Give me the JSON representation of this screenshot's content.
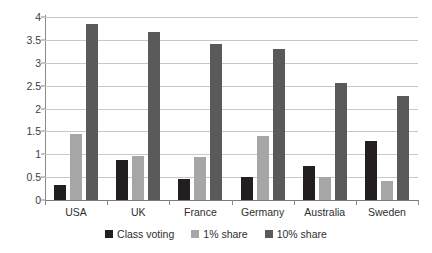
{
  "chart_data": {
    "type": "bar",
    "title": "",
    "subtitle": "",
    "xlabel": "",
    "ylabel": "",
    "categories": [
      "USA",
      "UK",
      "France",
      "Germany",
      "Australia",
      "Sweden"
    ],
    "series": [
      {
        "name": "Class voting",
        "color": "#231f20",
        "values": [
          0.33,
          0.88,
          0.45,
          0.5,
          0.75,
          1.28
        ]
      },
      {
        "name": "1% share",
        "color": "#a6a6a6",
        "values": [
          1.45,
          0.97,
          0.95,
          1.4,
          0.5,
          0.42
        ]
      },
      {
        "name": "10% share",
        "color": "#5a5a5a",
        "values": [
          3.85,
          3.67,
          3.4,
          3.3,
          2.55,
          2.27
        ]
      }
    ],
    "ylim": [
      0,
      4
    ],
    "ytick_step": 0.5,
    "ytick_labels": [
      "0",
      "0.5",
      "1",
      "1.5",
      "2",
      "2.5",
      "3",
      "3.5",
      "4"
    ],
    "grid": true,
    "grid_axis": "y",
    "legend_position": "bottom"
  },
  "legend": {
    "items": [
      {
        "label": "Class voting"
      },
      {
        "label": "1% share"
      },
      {
        "label": "10% share"
      }
    ]
  }
}
